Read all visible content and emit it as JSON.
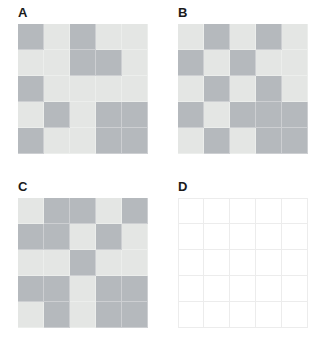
{
  "figure": {
    "background_color": "#ffffff",
    "width": 323,
    "height": 353,
    "layout": "2x2 panel grid"
  },
  "colors": {
    "dark_cell": "#b5b9bd",
    "light_cell": "#e4e6e4",
    "empty_cell": "#ffffff",
    "gridline": "#ececec",
    "label_text": "#1a1a1a"
  },
  "chart_data": {
    "type": "heatmap",
    "title": "",
    "xlabel": "",
    "ylabel": "",
    "grid": true,
    "legend": "none",
    "rows": 5,
    "cols": 5,
    "value_levels": [
      "light",
      "dark",
      "empty"
    ],
    "panels": [
      {
        "label": "A",
        "matrix": [
          [
            "dark",
            "light",
            "dark",
            "light",
            "light"
          ],
          [
            "light",
            "light",
            "dark",
            "dark",
            "light"
          ],
          [
            "dark",
            "light",
            "light",
            "light",
            "light"
          ],
          [
            "light",
            "dark",
            "light",
            "dark",
            "dark"
          ],
          [
            "dark",
            "light",
            "light",
            "dark",
            "dark"
          ]
        ]
      },
      {
        "label": "B",
        "matrix": [
          [
            "light",
            "dark",
            "light",
            "dark",
            "light"
          ],
          [
            "dark",
            "light",
            "dark",
            "light",
            "light"
          ],
          [
            "light",
            "dark",
            "light",
            "dark",
            "light"
          ],
          [
            "dark",
            "light",
            "dark",
            "dark",
            "dark"
          ],
          [
            "light",
            "dark",
            "light",
            "dark",
            "dark"
          ]
        ]
      },
      {
        "label": "C",
        "matrix": [
          [
            "light",
            "dark",
            "dark",
            "light",
            "dark"
          ],
          [
            "dark",
            "dark",
            "light",
            "dark",
            "light"
          ],
          [
            "light",
            "light",
            "dark",
            "light",
            "light"
          ],
          [
            "dark",
            "dark",
            "light",
            "dark",
            "dark"
          ],
          [
            "light",
            "dark",
            "light",
            "dark",
            "dark"
          ]
        ]
      },
      {
        "label": "D",
        "matrix": [
          [
            "empty",
            "empty",
            "empty",
            "empty",
            "empty"
          ],
          [
            "empty",
            "empty",
            "empty",
            "empty",
            "empty"
          ],
          [
            "empty",
            "empty",
            "empty",
            "empty",
            "empty"
          ],
          [
            "empty",
            "empty",
            "empty",
            "empty",
            "empty"
          ],
          [
            "empty",
            "empty",
            "empty",
            "empty",
            "empty"
          ]
        ]
      }
    ]
  }
}
